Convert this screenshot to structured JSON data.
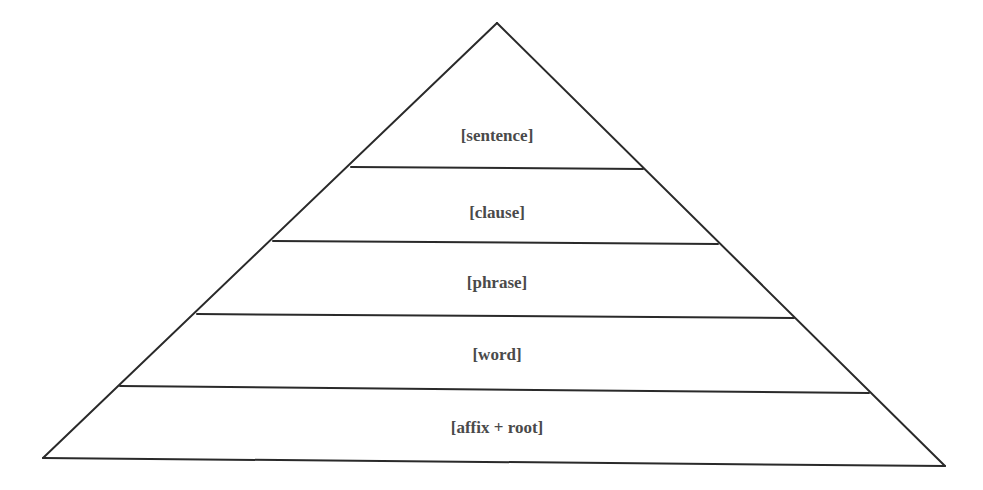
{
  "diagram": {
    "type": "pyramid",
    "colors": {
      "stroke": "#2a2a2a",
      "text": "#4a4a4a",
      "background": "#ffffff"
    },
    "levels": [
      {
        "label": "[sentence]",
        "position": "top"
      },
      {
        "label": "[clause]"
      },
      {
        "label": "[phrase]"
      },
      {
        "label": "[word]"
      },
      {
        "label": "[affix + root]",
        "position": "bottom"
      }
    ]
  }
}
